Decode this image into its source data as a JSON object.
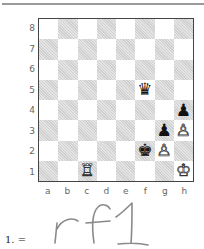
{
  "board": {
    "ranks": [
      "8",
      "7",
      "6",
      "5",
      "4",
      "3",
      "2",
      "1"
    ],
    "files": [
      "a",
      "b",
      "c",
      "d",
      "e",
      "f",
      "g",
      "h"
    ],
    "light_color": "#ffffff",
    "dark_color": "#cfcfcf",
    "pieces": [
      {
        "square": "f5",
        "piece": "queen",
        "color": "black",
        "glyph": "♛"
      },
      {
        "square": "h4",
        "piece": "pawn",
        "color": "black",
        "glyph": "♟"
      },
      {
        "square": "g3",
        "piece": "pawn",
        "color": "black",
        "glyph": "♟"
      },
      {
        "square": "h3",
        "piece": "pawn",
        "color": "white",
        "glyph": "♙"
      },
      {
        "square": "f2",
        "piece": "king",
        "color": "black",
        "glyph": "♚"
      },
      {
        "square": "g2",
        "piece": "pawn",
        "color": "white",
        "glyph": "♙"
      },
      {
        "square": "c1",
        "piece": "rook",
        "color": "white",
        "glyph": "♖"
      },
      {
        "square": "h1",
        "piece": "king",
        "color": "white",
        "glyph": "♔"
      }
    ]
  },
  "annotation": {
    "move_number": "1. =",
    "handwritten_answer": "rf1"
  }
}
